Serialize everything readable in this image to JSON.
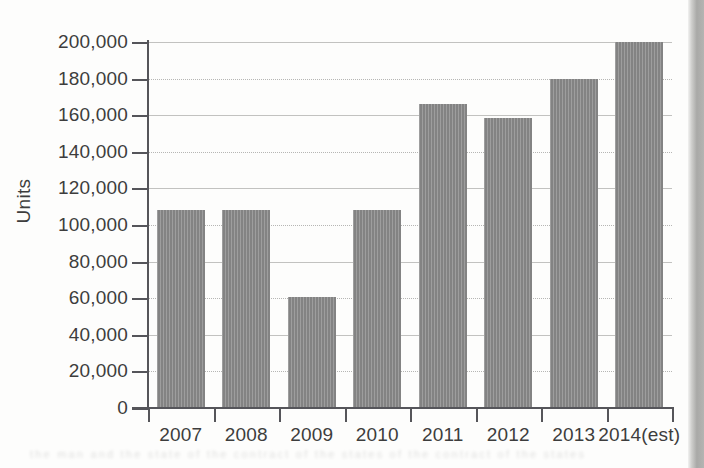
{
  "chart_data": {
    "type": "bar",
    "title": "",
    "xlabel": "",
    "ylabel": "Units",
    "categories": [
      "2007",
      "2008",
      "2009",
      "2010",
      "2011",
      "2012",
      "2013",
      "2014(est)"
    ],
    "values": [
      108000,
      108000,
      60500,
      108000,
      166000,
      158500,
      180000,
      200000
    ],
    "series": [
      {
        "name": "Units",
        "values": [
          108000,
          108000,
          60500,
          108000,
          166000,
          158500,
          180000,
          200000
        ]
      }
    ],
    "ylim": [
      0,
      200000
    ],
    "ytick_values": [
      0,
      20000,
      40000,
      60000,
      80000,
      100000,
      120000,
      140000,
      160000,
      180000,
      200000
    ],
    "ytick_labels": [
      "0",
      "20,000",
      "40,000",
      "60,000",
      "80,000",
      "100,000",
      "120,000",
      "140,000",
      "160,000",
      "180,000",
      "200,000"
    ],
    "grid": true,
    "grid_axis": "y",
    "legend": false,
    "legend_position": "none",
    "bar_color": "#8a8a8a",
    "axis_color": "#55555a",
    "gridline_color": "#b6b6b4",
    "text_color": "#3d3d3d",
    "background_color": "#fdfdfc"
  },
  "figure": {
    "y_axis_title": "Units"
  },
  "scan": {
    "edge_strip_color": "#a9a9a7",
    "bottom_bleed_text": "the man and the state of the contract of the states of the contract of the states"
  }
}
